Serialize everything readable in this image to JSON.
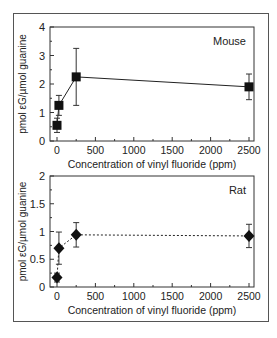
{
  "chart_data": [
    {
      "type": "line",
      "title": "",
      "annotation": "Mouse",
      "xlabel": "Concentration of vinyl fluoride (ppm)",
      "ylabel": "pmol εG/µmol guanine",
      "xlim": [
        0,
        2500
      ],
      "ylim": [
        0,
        4
      ],
      "xticks": [
        "0",
        "500",
        "1000",
        "1500",
        "2000",
        "2500"
      ],
      "yticks": [
        "0",
        "1",
        "2",
        "3",
        "4"
      ],
      "line_style": "solid",
      "marker": "square",
      "series": [
        {
          "name": "Mouse",
          "x": [
            0,
            25,
            250,
            2500
          ],
          "y": [
            0.55,
            1.25,
            2.25,
            1.9
          ],
          "err": [
            0.25,
            0.35,
            1.0,
            0.45
          ]
        }
      ]
    },
    {
      "type": "line",
      "title": "",
      "annotation": "Rat",
      "xlabel": "Concentration of vinyl fluoride (ppm)",
      "ylabel": "pmol εG/µmol guanine",
      "xlim": [
        0,
        2500
      ],
      "ylim": [
        0,
        2
      ],
      "xticks": [
        "0",
        "500",
        "1000",
        "1500",
        "2000",
        "2500"
      ],
      "yticks": [
        "0",
        "0.5",
        "1",
        "1.5",
        "2"
      ],
      "line_style": "dashed",
      "marker": "diamond",
      "series": [
        {
          "name": "Rat",
          "x": [
            0,
            25,
            250,
            2500
          ],
          "y": [
            0.17,
            0.7,
            0.94,
            0.92
          ],
          "err": [
            0.08,
            0.29,
            0.22,
            0.21
          ]
        }
      ]
    }
  ]
}
